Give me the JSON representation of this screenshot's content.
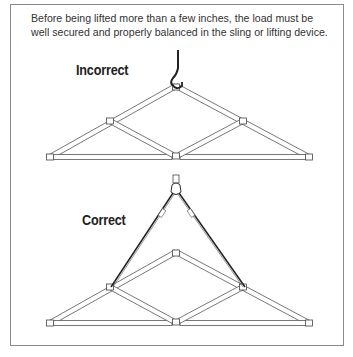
{
  "caption": "Before being lifted more than a few inches, the load must be well secured and properly balanced in the sling or lifting device.",
  "figures": [
    {
      "label": "Incorrect",
      "rigging": "single-hook-at-apex"
    },
    {
      "label": "Correct",
      "rigging": "two-leg-sling-at-side-nodes"
    }
  ],
  "colors": {
    "line": "#444444",
    "frame": "#8a8a8a",
    "text": "#333333"
  }
}
